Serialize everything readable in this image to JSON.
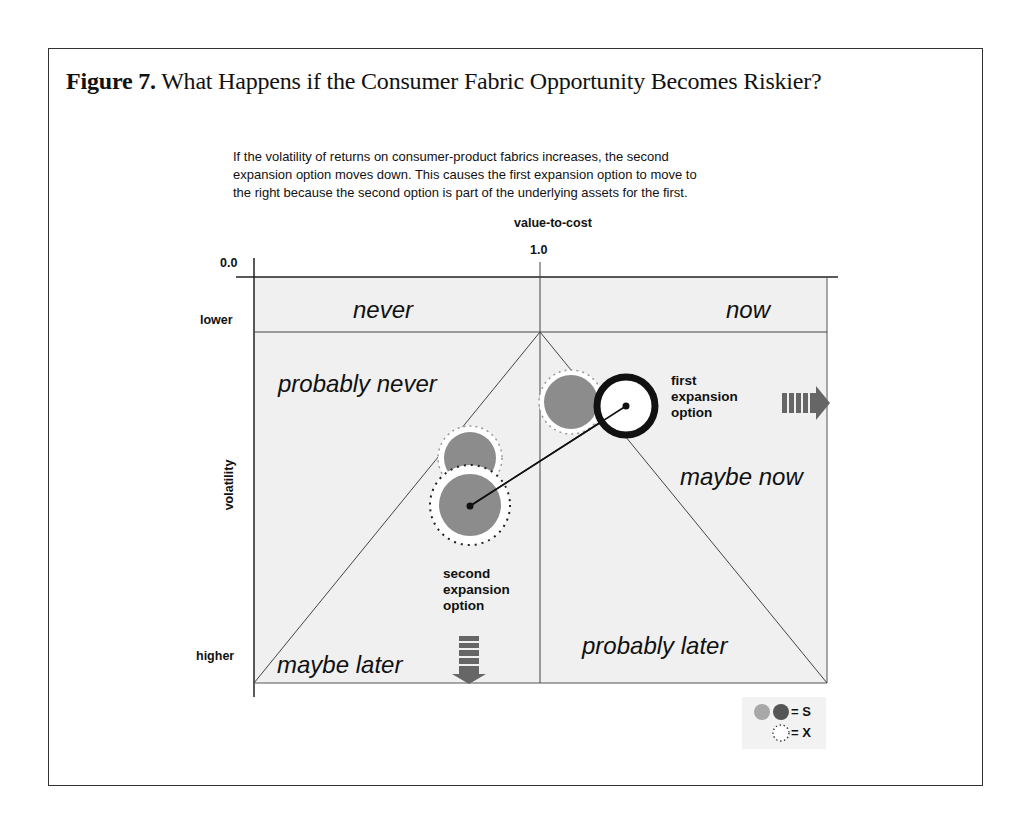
{
  "figure": {
    "number_label": "Figure 7.",
    "title": "What Happens if the Consumer Fabric Opportunity Becomes Riskier?",
    "caption_lines": [
      "If the volatility of returns on consumer-product fabrics increases, the second",
      "expansion option moves down. This causes the first expansion option to move to",
      "the right because the second option is part of the underlying assets for the first."
    ]
  },
  "axes": {
    "x_title": "value-to-cost",
    "x_ticks": [
      "0.0",
      "1.0"
    ],
    "y_title": "volatility",
    "y_ticks": [
      "lower",
      "higher"
    ]
  },
  "regions": {
    "never": "never",
    "now": "now",
    "probably_never": "probably never",
    "maybe_now": "maybe now",
    "probably_later": "probably later",
    "maybe_later": "maybe later"
  },
  "options": {
    "first": {
      "label_lines": [
        "first",
        "expansion",
        "option"
      ],
      "movement": "right"
    },
    "second": {
      "label_lines": [
        "second",
        "expansion",
        "option"
      ],
      "movement": "down"
    }
  },
  "legend": {
    "s_label": "= S",
    "x_label": "= X"
  },
  "colors": {
    "plot_background": "#f0f0f0",
    "circle_gray": "#8c8c8c",
    "circle_light_gray": "#a8a8a8",
    "circle_dark": "#555555",
    "arrow_gray": "#666666",
    "line": "#333333"
  }
}
